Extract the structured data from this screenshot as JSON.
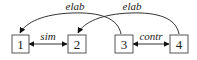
{
  "diagram": {
    "nodes": [
      {
        "id": "1",
        "label": "1"
      },
      {
        "id": "2",
        "label": "2"
      },
      {
        "id": "3",
        "label": "3"
      },
      {
        "id": "4",
        "label": "4"
      }
    ],
    "edges": [
      {
        "from": "3",
        "to": "1",
        "label": "elab",
        "type": "arc-directed"
      },
      {
        "from": "4",
        "to": "2",
        "label": "elab",
        "type": "arc-directed"
      },
      {
        "from": "1",
        "to": "2",
        "label": "sim",
        "type": "bidirectional"
      },
      {
        "from": "3",
        "to": "4",
        "label": "contr",
        "type": "bidirectional"
      }
    ]
  }
}
